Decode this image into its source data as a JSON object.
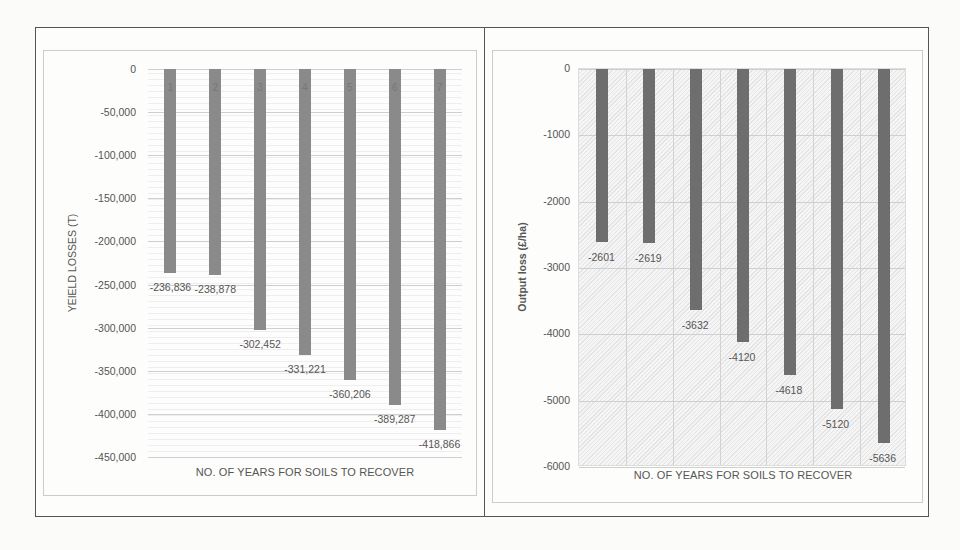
{
  "chart_data": [
    {
      "type": "bar",
      "title": "",
      "xlabel": "NO. OF YEARS FOR SOILS TO RECOVER",
      "ylabel": "YEIELD LOSSES (T)",
      "categories": [
        "1",
        "2",
        "3",
        "4",
        "5",
        "6",
        "7"
      ],
      "values": [
        -236836,
        -238878,
        -302452,
        -331221,
        -360206,
        -389287,
        -418866
      ],
      "data_labels": [
        "-236,836",
        "-238,878",
        "-302,452",
        "-331,221",
        "-360,206",
        "-389,287",
        "-418,866"
      ],
      "yticks": [
        "0",
        "-50,000",
        "-100,000",
        "-150,000",
        "-200,000",
        "-250,000",
        "-300,000",
        "-350,000",
        "-400,000",
        "-450,000"
      ],
      "ylim": [
        -450000,
        0
      ],
      "grid": true,
      "legend": "none",
      "bar_color": "#8a8a8a"
    },
    {
      "type": "bar",
      "title": "",
      "xlabel": "NO. OF YEARS FOR SOILS TO RECOVER",
      "ylabel": "Output loss (£/ha)",
      "categories": [
        "1",
        "2",
        "3",
        "4",
        "5",
        "6",
        "7"
      ],
      "values": [
        -2601,
        -2619,
        -3632,
        -4120,
        -4618,
        -5120,
        -5636
      ],
      "data_labels": [
        "-2601",
        "-2619",
        "-3632",
        "-4120",
        "-4618",
        "-5120",
        "-5636"
      ],
      "yticks": [
        "0",
        "-1000",
        "-2000",
        "-3000",
        "-4000",
        "-5000",
        "-6000"
      ],
      "ylim": [
        -6000,
        0
      ],
      "grid": true,
      "legend": "none",
      "bar_color": "#6e6e6e"
    }
  ]
}
